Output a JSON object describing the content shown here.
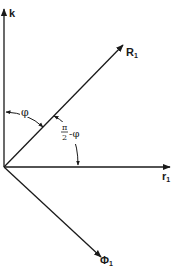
{
  "diagram": {
    "type": "vector-diagram",
    "colors": {
      "ink": "#1a1a1a",
      "background": "#ffffff"
    },
    "origin": [
      4,
      167
    ],
    "vectors": [
      {
        "id": "k",
        "label": "k",
        "subscript": "",
        "end": [
          4,
          8
        ]
      },
      {
        "id": "R1",
        "label": "R",
        "subscript": "1",
        "end": [
          123,
          45
        ]
      },
      {
        "id": "r1",
        "label": "r",
        "subscript": "1",
        "end": [
          170,
          167
        ]
      },
      {
        "id": "Phi1",
        "label": "Φ",
        "subscript": "1",
        "end": [
          101,
          257
        ]
      }
    ],
    "angles": [
      {
        "id": "phi",
        "label": "φ",
        "between": [
          "k",
          "R1"
        ]
      },
      {
        "id": "pi-half-minus-phi",
        "numerator": "π",
        "denominator": "2",
        "suffix": "-φ",
        "between": [
          "R1",
          "r1"
        ]
      }
    ]
  }
}
